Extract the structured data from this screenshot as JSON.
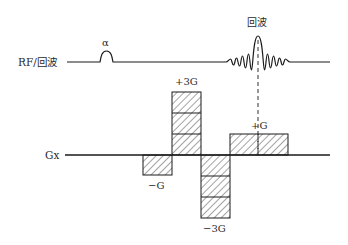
{
  "diagram": {
    "title": "",
    "rows": {
      "rf": {
        "label": "RF/回波"
      },
      "gx": {
        "label": "Gx"
      }
    },
    "rf_pulse": {
      "label": "α"
    },
    "echo": {
      "label": "回波"
    },
    "gradient_lobes": [
      {
        "id": "neg-g",
        "label": "−G",
        "amplitude": -1,
        "units": 1
      },
      {
        "id": "pos-3g",
        "label": "+3G",
        "amplitude": 3,
        "units": 1
      },
      {
        "id": "neg-3g",
        "label": "−3G",
        "amplitude": -3,
        "units": 1
      },
      {
        "id": "pos-g",
        "label": "+G",
        "amplitude": 1,
        "units": 2
      }
    ],
    "colors": {
      "stroke": "#1a1a1a",
      "text": "#2a2a2a",
      "background": "#ffffff"
    }
  }
}
